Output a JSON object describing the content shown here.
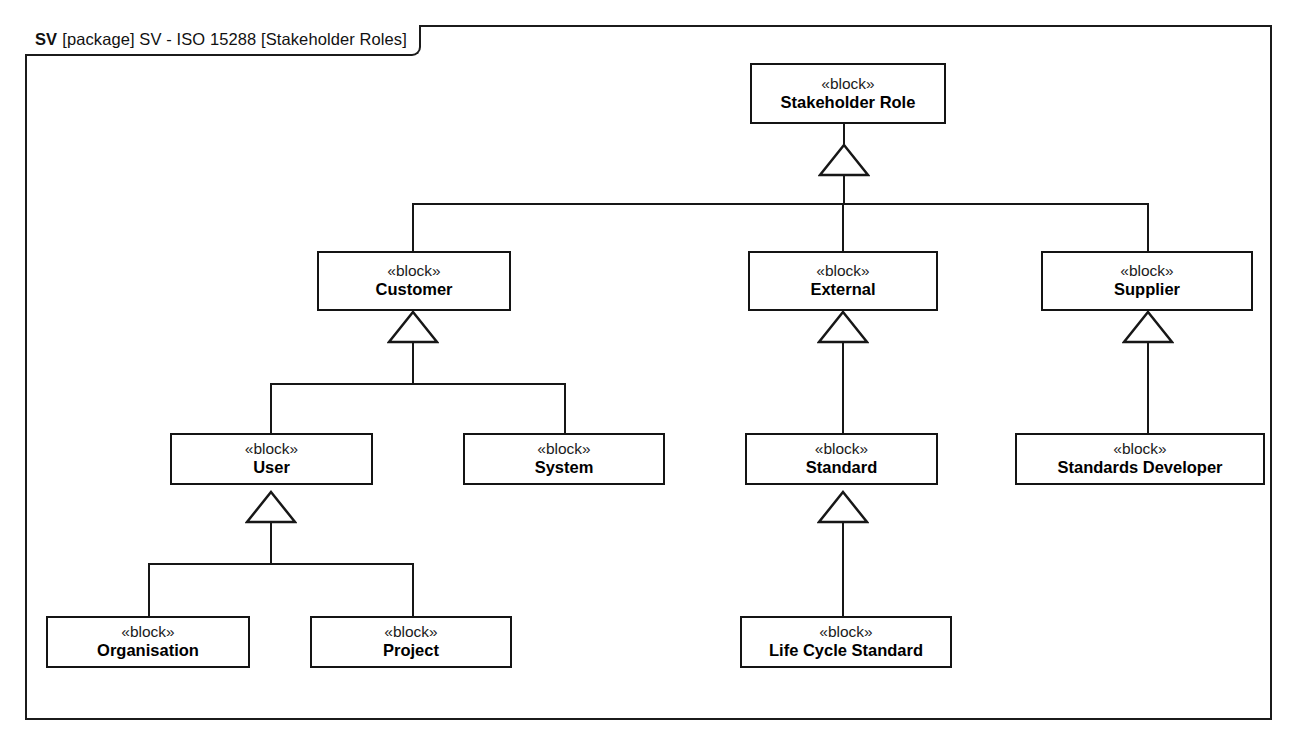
{
  "diagram": {
    "frame_label": {
      "prefix": "SV",
      "rest": "[package] SV - ISO 15288 [Stakeholder Roles]"
    },
    "stereotype": "«block»",
    "line_color": "#171717",
    "background_color": "#ffffff",
    "blocks": {
      "stakeholder_role": "Stakeholder Role",
      "customer": "Customer",
      "external": "External",
      "supplier": "Supplier",
      "user": "User",
      "system": "System",
      "standard": "Standard",
      "standards_developer": "Standards Developer",
      "organisation": "Organisation",
      "project": "Project",
      "life_cycle_standard": "Life Cycle Standard"
    },
    "generalizations": [
      {
        "child": "Customer",
        "parent": "Stakeholder Role"
      },
      {
        "child": "External",
        "parent": "Stakeholder Role"
      },
      {
        "child": "Supplier",
        "parent": "Stakeholder Role"
      },
      {
        "child": "User",
        "parent": "Customer"
      },
      {
        "child": "System",
        "parent": "Customer"
      },
      {
        "child": "Standard",
        "parent": "External"
      },
      {
        "child": "Standards Developer",
        "parent": "Supplier"
      },
      {
        "child": "Organisation",
        "parent": "User"
      },
      {
        "child": "Project",
        "parent": "User"
      },
      {
        "child": "Life Cycle Standard",
        "parent": "Standard"
      }
    ]
  }
}
